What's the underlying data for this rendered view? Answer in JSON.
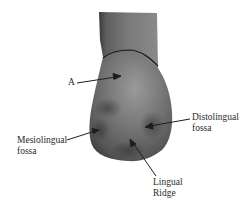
{
  "figure": {
    "colors": {
      "tooth_dark": "#3c3c3c",
      "tooth_mid": "#6b6b6b",
      "tooth_light": "#9a9a9a",
      "line": "#1e1e1e",
      "background": "#ffffff"
    },
    "labels": {
      "a": {
        "line1": "A"
      },
      "mesiolingual_fossa": {
        "line1": "Mesiolingual",
        "line2": "fossa"
      },
      "distolingual_fossa": {
        "line1": "Distolingual",
        "line2": "fossa"
      },
      "lingual_ridge": {
        "line1": "Lingual",
        "line2": "Ridge"
      }
    }
  }
}
